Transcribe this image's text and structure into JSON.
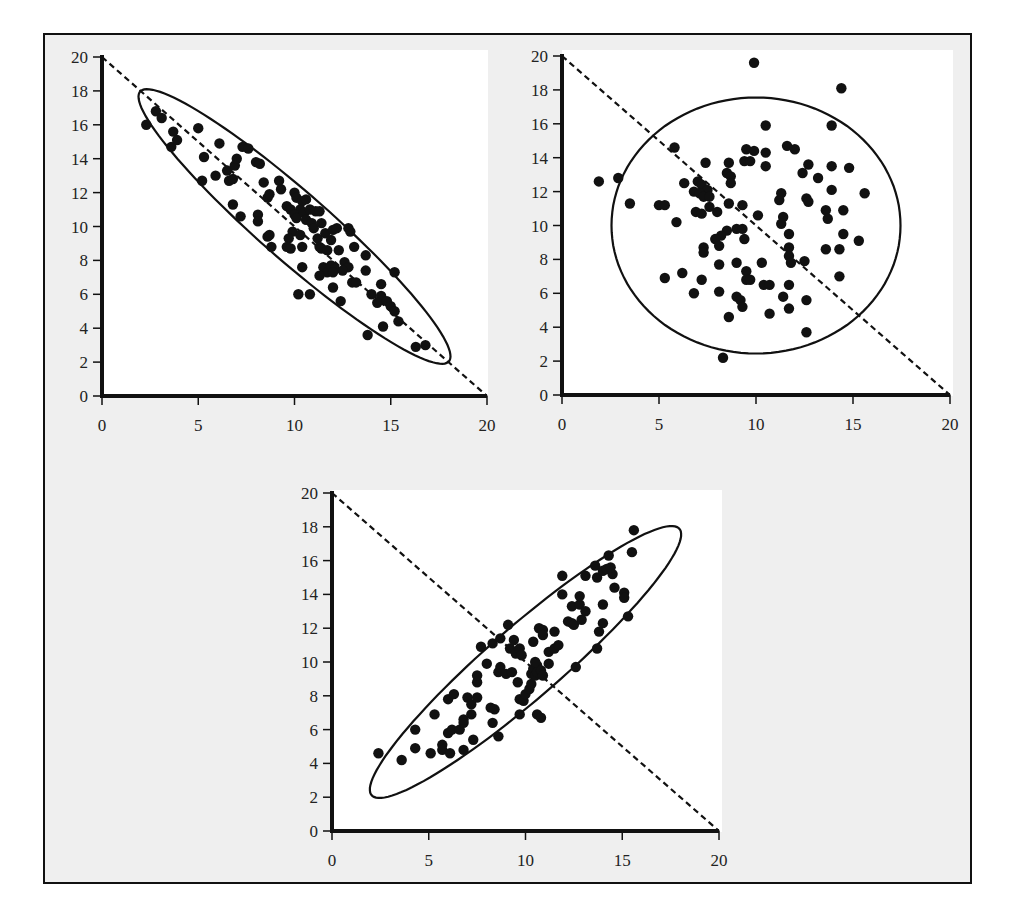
{
  "figure": {
    "background_color": "#efefef",
    "plot_background": "#ffffff",
    "ink_color": "#111111"
  },
  "chart_data": [
    {
      "id": "negative-correlation",
      "type": "scatter",
      "title": "",
      "xlabel": "",
      "ylabel": "",
      "xlim": [
        0,
        20
      ],
      "ylim": [
        0,
        20
      ],
      "xticks": [
        0,
        5,
        10,
        15,
        20
      ],
      "yticks": [
        0,
        2,
        4,
        6,
        8,
        10,
        12,
        14,
        16,
        18,
        20
      ],
      "grid": false,
      "reference_line": {
        "style": "dashed",
        "from": [
          0,
          20
        ],
        "to": [
          20,
          0
        ]
      },
      "ellipse": {
        "cx": 10,
        "cy": 10,
        "rx": 11.3,
        "ry": 1.9,
        "angle_deg": -45
      },
      "points": [
        [
          2.3,
          16.0
        ],
        [
          2.8,
          16.8
        ],
        [
          3.1,
          16.4
        ],
        [
          3.7,
          15.6
        ],
        [
          3.6,
          14.7
        ],
        [
          3.9,
          15.1
        ],
        [
          5.0,
          15.8
        ],
        [
          5.3,
          14.1
        ],
        [
          5.2,
          12.7
        ],
        [
          5.9,
          13.0
        ],
        [
          6.1,
          14.9
        ],
        [
          6.5,
          13.3
        ],
        [
          6.6,
          12.7
        ],
        [
          6.8,
          12.8
        ],
        [
          6.9,
          13.6
        ],
        [
          7.0,
          14.0
        ],
        [
          6.8,
          11.3
        ],
        [
          7.3,
          14.7
        ],
        [
          7.6,
          14.6
        ],
        [
          7.2,
          10.6
        ],
        [
          8.0,
          13.8
        ],
        [
          8.2,
          13.7
        ],
        [
          8.4,
          12.6
        ],
        [
          8.6,
          11.7
        ],
        [
          8.7,
          11.9
        ],
        [
          8.1,
          10.7
        ],
        [
          8.1,
          10.3
        ],
        [
          8.6,
          9.4
        ],
        [
          8.7,
          9.5
        ],
        [
          8.8,
          8.8
        ],
        [
          9.2,
          12.7
        ],
        [
          9.3,
          12.2
        ],
        [
          9.6,
          11.2
        ],
        [
          9.8,
          11.0
        ],
        [
          10.0,
          12.0
        ],
        [
          10.1,
          11.7
        ],
        [
          10.4,
          11.5
        ],
        [
          10.6,
          11.6
        ],
        [
          10.3,
          11.0
        ],
        [
          10.0,
          10.7
        ],
        [
          10.1,
          10.5
        ],
        [
          10.5,
          10.8
        ],
        [
          10.6,
          10.4
        ],
        [
          10.8,
          11.0
        ],
        [
          11.1,
          10.9
        ],
        [
          11.3,
          10.9
        ],
        [
          10.9,
          10.2
        ],
        [
          11.0,
          9.9
        ],
        [
          11.4,
          10.2
        ],
        [
          11.6,
          9.6
        ],
        [
          12.0,
          9.8
        ],
        [
          12.2,
          9.9
        ],
        [
          9.9,
          9.7
        ],
        [
          9.7,
          9.3
        ],
        [
          9.6,
          8.8
        ],
        [
          9.8,
          8.7
        ],
        [
          10.3,
          9.5
        ],
        [
          10.4,
          8.8
        ],
        [
          11.2,
          9.3
        ],
        [
          11.3,
          8.8
        ],
        [
          11.4,
          8.7
        ],
        [
          11.7,
          8.6
        ],
        [
          11.9,
          9.2
        ],
        [
          12.3,
          8.6
        ],
        [
          12.8,
          9.9
        ],
        [
          12.9,
          9.7
        ],
        [
          13.1,
          8.8
        ],
        [
          13.7,
          8.3
        ],
        [
          12.6,
          7.9
        ],
        [
          12.8,
          7.6
        ],
        [
          11.5,
          7.6
        ],
        [
          11.7,
          7.3
        ],
        [
          11.3,
          7.1
        ],
        [
          11.9,
          7.7
        ],
        [
          12.1,
          7.5
        ],
        [
          12.5,
          7.4
        ],
        [
          12.0,
          7.3
        ],
        [
          10.4,
          7.6
        ],
        [
          13.0,
          6.7
        ],
        [
          13.2,
          6.7
        ],
        [
          13.7,
          7.4
        ],
        [
          12.0,
          6.4
        ],
        [
          10.2,
          6.0
        ],
        [
          10.8,
          6.0
        ],
        [
          12.4,
          5.6
        ],
        [
          14.0,
          6.0
        ],
        [
          14.5,
          6.6
        ],
        [
          14.5,
          5.9
        ],
        [
          14.3,
          5.5
        ],
        [
          14.8,
          5.6
        ],
        [
          15.0,
          5.3
        ],
        [
          15.2,
          5.0
        ],
        [
          15.2,
          7.3
        ],
        [
          15.4,
          4.4
        ],
        [
          14.6,
          4.1
        ],
        [
          13.8,
          3.6
        ],
        [
          16.3,
          2.9
        ],
        [
          16.8,
          3.0
        ]
      ]
    },
    {
      "id": "no-correlation",
      "type": "scatter",
      "title": "",
      "xlabel": "",
      "ylabel": "",
      "xlim": [
        0,
        20
      ],
      "ylim": [
        0,
        20
      ],
      "xticks": [
        0,
        5,
        10,
        15,
        20
      ],
      "yticks": [
        0,
        2,
        4,
        6,
        8,
        10,
        12,
        14,
        16,
        18,
        20
      ],
      "grid": false,
      "reference_line": {
        "style": "dashed",
        "from": [
          0,
          20
        ],
        "to": [
          20,
          0
        ]
      },
      "ellipse": {
        "cx": 10,
        "cy": 10,
        "rx": 7.45,
        "ry": 7.55,
        "angle_deg": 0
      },
      "points": [
        [
          9.9,
          19.6
        ],
        [
          14.4,
          18.1
        ],
        [
          13.9,
          15.9
        ],
        [
          10.5,
          15.9
        ],
        [
          5.8,
          14.6
        ],
        [
          9.5,
          14.5
        ],
        [
          9.9,
          14.4
        ],
        [
          11.6,
          14.7
        ],
        [
          12.0,
          14.5
        ],
        [
          10.5,
          14.3
        ],
        [
          7.4,
          13.7
        ],
        [
          8.6,
          13.7
        ],
        [
          9.4,
          13.8
        ],
        [
          9.7,
          13.8
        ],
        [
          10.5,
          13.5
        ],
        [
          12.7,
          13.6
        ],
        [
          13.9,
          13.5
        ],
        [
          14.8,
          13.4
        ],
        [
          12.4,
          13.1
        ],
        [
          13.2,
          12.8
        ],
        [
          8.5,
          13.1
        ],
        [
          8.7,
          12.9
        ],
        [
          8.7,
          12.5
        ],
        [
          7.0,
          12.6
        ],
        [
          7.2,
          12.4
        ],
        [
          7.5,
          12.1
        ],
        [
          6.8,
          12.0
        ],
        [
          7.1,
          11.9
        ],
        [
          7.3,
          11.7
        ],
        [
          7.6,
          11.7
        ],
        [
          6.3,
          12.5
        ],
        [
          1.9,
          12.6
        ],
        [
          2.9,
          12.8
        ],
        [
          3.5,
          11.3
        ],
        [
          5.0,
          11.2
        ],
        [
          5.3,
          11.2
        ],
        [
          7.6,
          11.1
        ],
        [
          8.6,
          11.3
        ],
        [
          9.3,
          11.2
        ],
        [
          11.2,
          11.5
        ],
        [
          11.3,
          11.9
        ],
        [
          12.6,
          11.6
        ],
        [
          12.7,
          11.4
        ],
        [
          13.9,
          12.1
        ],
        [
          15.6,
          11.9
        ],
        [
          13.6,
          10.9
        ],
        [
          13.7,
          10.4
        ],
        [
          14.5,
          10.9
        ],
        [
          6.9,
          10.8
        ],
        [
          7.2,
          10.7
        ],
        [
          8.0,
          10.8
        ],
        [
          10.1,
          10.6
        ],
        [
          11.4,
          10.5
        ],
        [
          11.3,
          10.1
        ],
        [
          5.9,
          10.2
        ],
        [
          9.0,
          9.8
        ],
        [
          9.3,
          9.8
        ],
        [
          8.5,
          9.7
        ],
        [
          8.2,
          9.4
        ],
        [
          7.9,
          9.2
        ],
        [
          9.4,
          9.2
        ],
        [
          11.7,
          9.5
        ],
        [
          14.5,
          9.5
        ],
        [
          15.3,
          9.1
        ],
        [
          7.3,
          8.7
        ],
        [
          7.3,
          8.4
        ],
        [
          8.1,
          8.8
        ],
        [
          11.7,
          8.7
        ],
        [
          11.7,
          8.2
        ],
        [
          11.8,
          7.8
        ],
        [
          13.6,
          8.6
        ],
        [
          14.3,
          8.6
        ],
        [
          12.5,
          7.9
        ],
        [
          9.0,
          7.8
        ],
        [
          10.3,
          7.8
        ],
        [
          8.1,
          7.7
        ],
        [
          9.5,
          7.3
        ],
        [
          9.5,
          6.8
        ],
        [
          9.7,
          6.8
        ],
        [
          5.3,
          6.9
        ],
        [
          6.2,
          7.2
        ],
        [
          7.2,
          6.8
        ],
        [
          10.4,
          6.5
        ],
        [
          10.7,
          6.5
        ],
        [
          11.7,
          6.5
        ],
        [
          14.3,
          7.0
        ],
        [
          6.8,
          6.0
        ],
        [
          8.1,
          6.1
        ],
        [
          9.0,
          5.8
        ],
        [
          9.2,
          5.6
        ],
        [
          9.3,
          5.2
        ],
        [
          11.4,
          5.8
        ],
        [
          12.6,
          5.6
        ],
        [
          11.7,
          5.1
        ],
        [
          10.7,
          4.8
        ],
        [
          8.6,
          4.6
        ],
        [
          12.6,
          3.7
        ],
        [
          8.3,
          2.2
        ]
      ]
    },
    {
      "id": "positive-correlation",
      "type": "scatter",
      "title": "",
      "xlabel": "",
      "ylabel": "",
      "xlim": [
        0,
        20
      ],
      "ylim": [
        0,
        20
      ],
      "xticks": [
        0,
        5,
        10,
        15,
        20
      ],
      "yticks": [
        0,
        2,
        4,
        6,
        8,
        10,
        12,
        14,
        16,
        18,
        20
      ],
      "grid": false,
      "reference_line": {
        "style": "dashed",
        "from": [
          0,
          20
        ],
        "to": [
          20,
          0
        ]
      },
      "ellipse": {
        "cx": 10,
        "cy": 10,
        "rx": 11.2,
        "ry": 2.0,
        "angle_deg": 45
      },
      "points": [
        [
          2.4,
          4.6
        ],
        [
          3.6,
          4.2
        ],
        [
          4.3,
          4.9
        ],
        [
          4.3,
          6.0
        ],
        [
          5.1,
          4.6
        ],
        [
          5.3,
          6.9
        ],
        [
          5.7,
          5.1
        ],
        [
          5.7,
          4.8
        ],
        [
          6.0,
          5.8
        ],
        [
          6.2,
          6.0
        ],
        [
          6.1,
          4.6
        ],
        [
          6.0,
          7.8
        ],
        [
          6.3,
          8.1
        ],
        [
          6.6,
          6.0
        ],
        [
          6.8,
          6.4
        ],
        [
          6.8,
          6.6
        ],
        [
          6.8,
          4.8
        ],
        [
          7.0,
          7.9
        ],
        [
          7.2,
          7.5
        ],
        [
          7.2,
          6.9
        ],
        [
          7.3,
          5.4
        ],
        [
          7.5,
          7.9
        ],
        [
          7.5,
          8.8
        ],
        [
          7.5,
          9.2
        ],
        [
          7.7,
          10.9
        ],
        [
          8.0,
          9.9
        ],
        [
          8.3,
          11.1
        ],
        [
          8.2,
          7.3
        ],
        [
          8.4,
          7.2
        ],
        [
          8.3,
          6.4
        ],
        [
          8.6,
          9.4
        ],
        [
          8.7,
          9.7
        ],
        [
          8.7,
          11.4
        ],
        [
          8.6,
          5.6
        ],
        [
          9.0,
          9.3
        ],
        [
          9.3,
          9.4
        ],
        [
          9.1,
          12.2
        ],
        [
          9.2,
          10.8
        ],
        [
          9.4,
          11.3
        ],
        [
          9.5,
          10.5
        ],
        [
          9.7,
          10.8
        ],
        [
          9.8,
          10.4
        ],
        [
          9.6,
          8.8
        ],
        [
          9.7,
          7.8
        ],
        [
          9.9,
          7.7
        ],
        [
          9.7,
          6.9
        ],
        [
          10.0,
          8.1
        ],
        [
          10.2,
          8.4
        ],
        [
          10.3,
          8.7
        ],
        [
          10.3,
          9.3
        ],
        [
          10.4,
          9.6
        ],
        [
          10.5,
          9.2
        ],
        [
          10.6,
          9.8
        ],
        [
          10.5,
          10.0
        ],
        [
          10.6,
          9.4
        ],
        [
          10.8,
          9.5
        ],
        [
          10.9,
          9.2
        ],
        [
          10.4,
          11.2
        ],
        [
          10.6,
          6.9
        ],
        [
          10.8,
          6.7
        ],
        [
          10.7,
          12.0
        ],
        [
          10.9,
          11.9
        ],
        [
          10.9,
          11.6
        ],
        [
          11.2,
          9.9
        ],
        [
          11.2,
          10.6
        ],
        [
          11.5,
          10.8
        ],
        [
          11.5,
          11.8
        ],
        [
          11.7,
          11.0
        ],
        [
          11.9,
          14.0
        ],
        [
          11.9,
          15.1
        ],
        [
          12.2,
          12.4
        ],
        [
          12.4,
          12.3
        ],
        [
          12.4,
          13.3
        ],
        [
          12.5,
          12.2
        ],
        [
          12.6,
          9.7
        ],
        [
          12.8,
          13.4
        ],
        [
          12.8,
          13.9
        ],
        [
          12.9,
          12.5
        ],
        [
          13.1,
          15.1
        ],
        [
          13.1,
          13.0
        ],
        [
          13.6,
          15.7
        ],
        [
          13.7,
          15.0
        ],
        [
          13.7,
          10.8
        ],
        [
          13.8,
          11.8
        ],
        [
          14.0,
          12.3
        ],
        [
          14.0,
          13.4
        ],
        [
          14.0,
          15.4
        ],
        [
          14.2,
          15.5
        ],
        [
          14.3,
          16.3
        ],
        [
          14.5,
          15.2
        ],
        [
          14.6,
          14.4
        ],
        [
          14.4,
          15.6
        ],
        [
          15.1,
          14.1
        ],
        [
          15.1,
          13.8
        ],
        [
          15.3,
          12.7
        ],
        [
          15.5,
          16.5
        ],
        [
          15.6,
          17.8
        ]
      ]
    }
  ]
}
